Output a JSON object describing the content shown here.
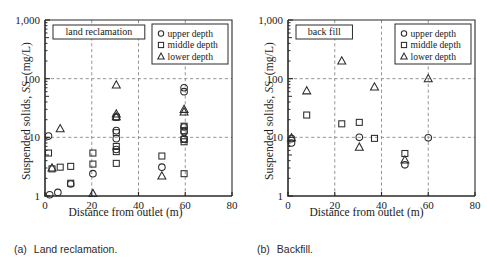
{
  "figure": {
    "panels": [
      {
        "id": "a",
        "caption_index": "(a)",
        "caption_text": "Land reclamation.",
        "tag": "land reclamation"
      },
      {
        "id": "b",
        "caption_index": "(b)",
        "caption_text": "Backfill.",
        "tag": "back fill"
      }
    ]
  },
  "chart_data": [
    {
      "type": "scatter",
      "title": "land reclamation",
      "subtitle": "(a) Land reclamation.",
      "xlabel": "Distance from outlet  (m)",
      "ylabel": "Suspended solids, SS  (mg/L)",
      "xlim": [
        0,
        80
      ],
      "ylim": [
        1,
        1000
      ],
      "yscale": "log",
      "xticks": [
        0,
        20,
        40,
        60,
        80
      ],
      "xtick_labels": [
        "0",
        "20",
        "40",
        "60",
        "80"
      ],
      "yticks": [
        1,
        10,
        100,
        1000
      ],
      "ytick_labels": [
        "1",
        "10",
        "100",
        "1,000"
      ],
      "grid": "dashed x at 20,40,60 and y at 10,100",
      "legend_position": "top-right",
      "series": [
        {
          "name": "upper depth",
          "marker": "circle",
          "points": [
            [
              1.5,
              10.5
            ],
            [
              2.0,
              1.05
            ],
            [
              5.5,
              1.15
            ],
            [
              11.0,
              1.6
            ],
            [
              20.5,
              2.4
            ],
            [
              30.5,
              22.0
            ],
            [
              30.5,
              13.0
            ],
            [
              30.5,
              9.5
            ],
            [
              30.5,
              6.2
            ],
            [
              50.0,
              3.1
            ],
            [
              59.5,
              70.0
            ],
            [
              59.5,
              60.0
            ],
            [
              59.5,
              15.0
            ],
            [
              59.5,
              12.5
            ],
            [
              59.5,
              9.5
            ]
          ]
        },
        {
          "name": "middle depth",
          "marker": "square",
          "points": [
            [
              1.5,
              5.4
            ],
            [
              3.0,
              2.9
            ],
            [
              6.5,
              3.1
            ],
            [
              11.0,
              3.2
            ],
            [
              11.0,
              1.65
            ],
            [
              20.5,
              5.4
            ],
            [
              20.5,
              3.5
            ],
            [
              30.5,
              22.0
            ],
            [
              30.5,
              12.0
            ],
            [
              30.5,
              7.0
            ],
            [
              30.5,
              5.7
            ],
            [
              30.5,
              3.6
            ],
            [
              50.0,
              4.8
            ],
            [
              59.5,
              15.5
            ],
            [
              59.5,
              13.0
            ],
            [
              59.5,
              9.2
            ],
            [
              59.5,
              8.4
            ],
            [
              59.5,
              2.4
            ]
          ]
        },
        {
          "name": "lower depth",
          "marker": "triangle",
          "points": [
            [
              3.0,
              3.0
            ],
            [
              6.5,
              14.0
            ],
            [
              20.5,
              1.1
            ],
            [
              30.5,
              78.0
            ],
            [
              30.5,
              25.0
            ],
            [
              30.5,
              22.5
            ],
            [
              50.0,
              2.2
            ],
            [
              59.5,
              30.0
            ],
            [
              59.5,
              27.0
            ]
          ]
        }
      ]
    },
    {
      "type": "scatter",
      "title": "back fill",
      "subtitle": "(b) Backfill.",
      "xlabel": "Distance from outlet (m)",
      "ylabel": "Suspended solids, SS  (mg/L)",
      "xlim": [
        0,
        80
      ],
      "ylim": [
        1,
        1000
      ],
      "yscale": "log",
      "xticks": [
        0,
        20,
        40,
        60,
        80
      ],
      "xtick_labels": [
        "0",
        "20",
        "40",
        "60",
        "80"
      ],
      "yticks": [
        1,
        10,
        100,
        1000
      ],
      "ytick_labels": [
        "1",
        "10",
        "100",
        "1,000"
      ],
      "grid": "dashed x at 20,40,60 and y at 10,100",
      "legend_position": "top-right",
      "series": [
        {
          "name": "upper depth",
          "marker": "circle",
          "points": [
            [
              1.5,
              8.0
            ],
            [
              1.5,
              9.5
            ],
            [
              30.5,
              10.0
            ],
            [
              50.0,
              3.4
            ],
            [
              60.0,
              9.8
            ]
          ]
        },
        {
          "name": "middle depth",
          "marker": "square",
          "points": [
            [
              8.0,
              24.0
            ],
            [
              23.0,
              17.0
            ],
            [
              30.5,
              18.0
            ],
            [
              37.0,
              9.6
            ],
            [
              50.0,
              5.3
            ]
          ]
        },
        {
          "name": "lower depth",
          "marker": "triangle",
          "points": [
            [
              1.5,
              9.8
            ],
            [
              8.0,
              62.0
            ],
            [
              23.0,
              200.0
            ],
            [
              30.5,
              6.8
            ],
            [
              37.0,
              72.0
            ],
            [
              50.0,
              4.1
            ],
            [
              60.0,
              100.0
            ]
          ]
        }
      ],
      "legend_entries": [
        "upper depth",
        "middle depth",
        "lower depth"
      ]
    }
  ]
}
